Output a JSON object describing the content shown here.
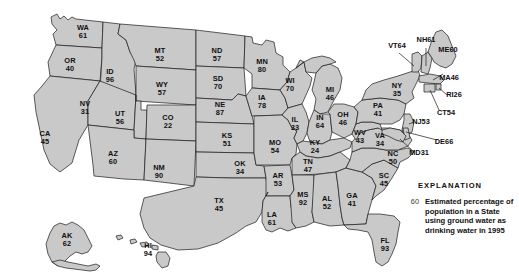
{
  "figure": {
    "kind": "choropleth-map",
    "region": "United States",
    "fill_color": "#c9c9c9",
    "border_color": "#1a1a1a",
    "background_color": "#ffffff",
    "label_color": "#101010"
  },
  "legend": {
    "title": "EXPLANATION",
    "sample_value": "60",
    "description_lines": [
      "Estimated percentage of",
      "population in a State",
      "using ground water as",
      "drinking water in 1995"
    ]
  },
  "chart_data": {
    "type": "map",
    "title": "Estimated percentage of population in a State using ground water as drinking water in 1995",
    "unit": "percent",
    "categories": [
      "WA",
      "OR",
      "ID",
      "MT",
      "ND",
      "MN",
      "WI",
      "MI",
      "NY",
      "VT",
      "NH",
      "ME",
      "MA",
      "RI",
      "CT",
      "NJ",
      "DE",
      "MD",
      "PA",
      "OH",
      "IN",
      "IL",
      "IA",
      "SD",
      "NE",
      "WY",
      "NV",
      "CA",
      "UT",
      "CO",
      "KS",
      "MO",
      "KY",
      "WV",
      "VA",
      "NC",
      "SC",
      "GA",
      "FL",
      "AL",
      "MS",
      "TN",
      "AR",
      "LA",
      "TX",
      "OK",
      "NM",
      "AZ",
      "AK",
      "HI"
    ],
    "values": [
      61,
      40,
      96,
      52,
      57,
      80,
      70,
      46,
      35,
      64,
      61,
      60,
      46,
      26,
      54,
      53,
      66,
      31,
      41,
      46,
      64,
      33,
      78,
      70,
      87,
      57,
      31,
      45,
      56,
      22,
      51,
      54,
      24,
      43,
      34,
      50,
      45,
      41,
      93,
      52,
      92,
      47,
      53,
      61,
      45,
      34,
      90,
      60,
      62,
      94
    ]
  },
  "states": [
    {
      "abbr": "WA",
      "value": "61",
      "x": 83,
      "y": 32
    },
    {
      "abbr": "OR",
      "value": "40",
      "x": 70,
      "y": 65
    },
    {
      "abbr": "ID",
      "value": "96",
      "x": 110,
      "y": 76
    },
    {
      "abbr": "MT",
      "value": "52",
      "x": 160,
      "y": 55
    },
    {
      "abbr": "ND",
      "value": "57",
      "x": 217,
      "y": 55
    },
    {
      "abbr": "MN",
      "value": "80",
      "x": 262,
      "y": 66
    },
    {
      "abbr": "WI",
      "value": "70",
      "x": 290,
      "y": 85
    },
    {
      "abbr": "MI",
      "value": "46",
      "x": 330,
      "y": 94
    },
    {
      "abbr": "SD",
      "value": "70",
      "x": 218,
      "y": 83
    },
    {
      "abbr": "NE",
      "value": "87",
      "x": 220,
      "y": 109
    },
    {
      "abbr": "IA",
      "value": "78",
      "x": 262,
      "y": 102
    },
    {
      "abbr": "WY",
      "value": "57",
      "x": 162,
      "y": 89
    },
    {
      "abbr": "NV",
      "value": "31",
      "x": 85,
      "y": 108
    },
    {
      "abbr": "UT",
      "value": "56",
      "x": 120,
      "y": 118
    },
    {
      "abbr": "CO",
      "value": "22",
      "x": 168,
      "y": 122
    },
    {
      "abbr": "CA",
      "value": "45",
      "x": 45,
      "y": 138
    },
    {
      "abbr": "AZ",
      "value": "60",
      "x": 113,
      "y": 158
    },
    {
      "abbr": "NM",
      "value": "90",
      "x": 159,
      "y": 172
    },
    {
      "abbr": "KS",
      "value": "51",
      "x": 227,
      "y": 140
    },
    {
      "abbr": "OK",
      "value": "34",
      "x": 240,
      "y": 168
    },
    {
      "abbr": "TX",
      "value": "45",
      "x": 219,
      "y": 205
    },
    {
      "abbr": "MO",
      "value": "54",
      "x": 275,
      "y": 147
    },
    {
      "abbr": "AR",
      "value": "53",
      "x": 278,
      "y": 180
    },
    {
      "abbr": "LA",
      "value": "61",
      "x": 272,
      "y": 219
    },
    {
      "abbr": "MS",
      "value": "92",
      "x": 303,
      "y": 199
    },
    {
      "abbr": "AL",
      "value": "52",
      "x": 327,
      "y": 203
    },
    {
      "abbr": "GA",
      "value": "41",
      "x": 352,
      "y": 200
    },
    {
      "abbr": "FL",
      "value": "93",
      "x": 385,
      "y": 245
    },
    {
      "abbr": "TN",
      "value": "47",
      "x": 308,
      "y": 166
    },
    {
      "abbr": "KY",
      "value": "24",
      "x": 315,
      "y": 147
    },
    {
      "abbr": "IL",
      "value": "33",
      "x": 295,
      "y": 124
    },
    {
      "abbr": "IN",
      "value": "64",
      "x": 320,
      "y": 122
    },
    {
      "abbr": "OH",
      "value": "46",
      "x": 343,
      "y": 119
    },
    {
      "abbr": "PA",
      "value": "41",
      "x": 378,
      "y": 110
    },
    {
      "abbr": "WV",
      "value": "43",
      "x": 360,
      "y": 137
    },
    {
      "abbr": "VA",
      "value": "34",
      "x": 380,
      "y": 140
    },
    {
      "abbr": "NC",
      "value": "50",
      "x": 393,
      "y": 158
    },
    {
      "abbr": "SC",
      "value": "45",
      "x": 384,
      "y": 180
    },
    {
      "abbr": "NY",
      "value": "35",
      "x": 397,
      "y": 90
    },
    {
      "abbr": "AK",
      "value": "62",
      "x": 67,
      "y": 240
    },
    {
      "abbr": "HI",
      "value": "94",
      "x": 148,
      "y": 250
    }
  ],
  "callouts": [
    {
      "abbr": "VT",
      "value": "64",
      "x": 397,
      "y": 46
    },
    {
      "abbr": "NH",
      "value": "61",
      "x": 426,
      "y": 40
    },
    {
      "abbr": "ME",
      "value": "60",
      "x": 448,
      "y": 50
    },
    {
      "abbr": "MA",
      "value": "46",
      "x": 449,
      "y": 78
    },
    {
      "abbr": "RI",
      "value": "26",
      "x": 454,
      "y": 95
    },
    {
      "abbr": "CT",
      "value": "54",
      "x": 446,
      "y": 113
    },
    {
      "abbr": "NJ",
      "value": "53",
      "x": 421,
      "y": 122
    },
    {
      "abbr": "DE",
      "value": "66",
      "x": 444,
      "y": 142
    },
    {
      "abbr": "MD",
      "value": "31",
      "x": 419,
      "y": 153
    }
  ]
}
